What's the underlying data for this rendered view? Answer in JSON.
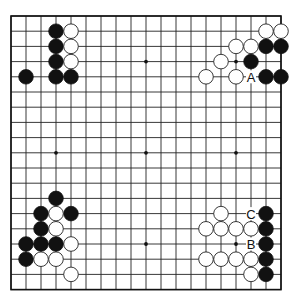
{
  "board": {
    "size": 19,
    "origin_x": 11,
    "origin_y": 16,
    "spacing_x": 15,
    "spacing_y": 15.2,
    "stone_radius": 7.3,
    "colors": {
      "line": "#222222",
      "black": "#111111",
      "white": "#ffffff"
    },
    "star_points": [
      [
        3,
        3
      ],
      [
        9,
        3
      ],
      [
        15,
        3
      ],
      [
        3,
        9
      ],
      [
        9,
        9
      ],
      [
        15,
        9
      ],
      [
        3,
        15
      ],
      [
        9,
        15
      ],
      [
        15,
        15
      ]
    ]
  },
  "stones": {
    "black": [
      [
        3,
        1
      ],
      [
        3,
        2
      ],
      [
        3,
        3
      ],
      [
        3,
        4
      ],
      [
        4,
        4
      ],
      [
        1,
        4
      ],
      [
        17,
        2
      ],
      [
        18,
        2
      ],
      [
        16,
        3
      ],
      [
        17,
        4
      ],
      [
        18,
        4
      ],
      [
        3,
        12
      ],
      [
        2,
        13
      ],
      [
        4,
        13
      ],
      [
        2,
        14
      ],
      [
        1,
        15
      ],
      [
        2,
        15
      ],
      [
        3,
        15
      ],
      [
        1,
        16
      ],
      [
        17,
        13
      ],
      [
        17,
        14
      ],
      [
        17,
        15
      ],
      [
        17,
        16
      ],
      [
        17,
        17
      ]
    ],
    "white": [
      [
        4,
        1
      ],
      [
        4,
        2
      ],
      [
        4,
        3
      ],
      [
        17,
        1
      ],
      [
        18,
        1
      ],
      [
        15,
        2
      ],
      [
        16,
        2
      ],
      [
        14,
        3
      ],
      [
        13,
        4
      ],
      [
        15,
        4
      ],
      [
        3,
        13
      ],
      [
        3,
        14
      ],
      [
        4,
        15
      ],
      [
        2,
        16
      ],
      [
        3,
        16
      ],
      [
        4,
        17
      ],
      [
        14,
        13
      ],
      [
        13,
        14
      ],
      [
        14,
        14
      ],
      [
        15,
        14
      ],
      [
        16,
        14
      ],
      [
        13,
        16
      ],
      [
        14,
        16
      ],
      [
        15,
        16
      ],
      [
        16,
        16
      ],
      [
        16,
        17
      ]
    ]
  },
  "labels": [
    {
      "text": "A",
      "col": 16,
      "row": 4
    },
    {
      "text": "B",
      "col": 16,
      "row": 15
    },
    {
      "text": "C",
      "col": 16,
      "row": 13
    }
  ]
}
